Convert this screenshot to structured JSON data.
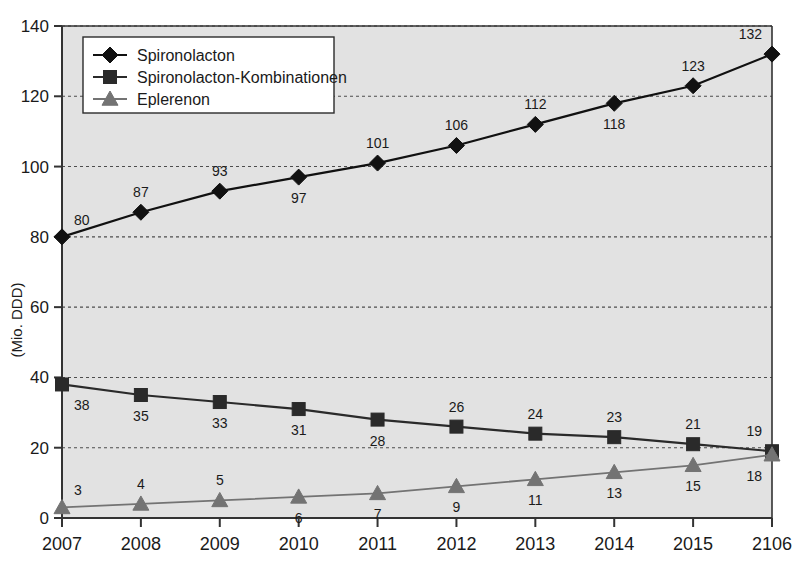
{
  "chart_data": {
    "type": "line",
    "title": "",
    "subtitle": "",
    "xlabel": "",
    "ylabel": "(Mio. DDD)",
    "categories": [
      "2007",
      "2008",
      "2009",
      "2010",
      "2011",
      "2012",
      "2013",
      "2014",
      "2015",
      "2106"
    ],
    "x_tick_labels": [
      "2007",
      "2008",
      "2009",
      "2010",
      "2011",
      "2012",
      "2013",
      "2014",
      "2015",
      "2106"
    ],
    "y_tick_labels": [
      "0",
      "20",
      "40",
      "60",
      "80",
      "100",
      "120",
      "140"
    ],
    "y_ticks": [
      0,
      20,
      40,
      60,
      80,
      100,
      120,
      140
    ],
    "ylim": [
      0,
      140
    ],
    "grid": true,
    "grid_style": "dashed-horizontal",
    "legend_position": "top-left",
    "plot_background": "#e2e2e2",
    "series": [
      {
        "name": "Spironolacton",
        "marker": "diamond",
        "color": "#111111",
        "values": [
          80,
          87,
          93,
          97,
          101,
          106,
          112,
          118,
          123,
          132
        ],
        "label_positions": [
          "above",
          "above",
          "above",
          "below",
          "above",
          "above",
          "above",
          "below",
          "above",
          "above"
        ]
      },
      {
        "name": "Spironolacton-Kombinationen",
        "marker": "square",
        "color": "#2a2a2a",
        "values": [
          38,
          35,
          33,
          31,
          28,
          26,
          24,
          23,
          21,
          19
        ],
        "label_positions": [
          "below",
          "below",
          "below",
          "below",
          "below",
          "above",
          "above",
          "above",
          "above",
          "above"
        ]
      },
      {
        "name": "Eplerenon",
        "marker": "triangle",
        "color": "#737373",
        "values": [
          3,
          4,
          5,
          6,
          7,
          9,
          11,
          13,
          15,
          18
        ],
        "label_positions": [
          "above",
          "above",
          "above",
          "below",
          "below",
          "below",
          "below",
          "below",
          "below",
          "below"
        ]
      }
    ]
  },
  "legend": {
    "items": [
      {
        "label": "Spironolacton",
        "marker": "diamond",
        "color": "#111111"
      },
      {
        "label": "Spironolacton-Kombinationen",
        "marker": "square",
        "color": "#2a2a2a"
      },
      {
        "label": "Eplerenon",
        "marker": "triangle",
        "color": "#737373"
      }
    ]
  },
  "axes": {
    "y_axis_title": "(Mio. DDD)"
  },
  "colors": {
    "plot_bg": "#e2e2e2",
    "axis": "#333333",
    "grid": "#4d4d4d",
    "series_dark": "#111111",
    "series_mid": "#2a2a2a",
    "series_gray": "#737373"
  }
}
